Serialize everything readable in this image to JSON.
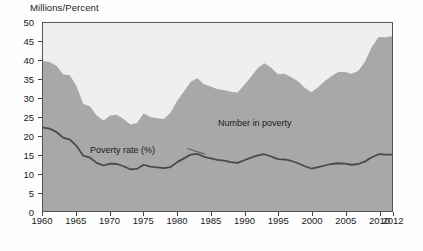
{
  "axis_title": "Millions/Percent",
  "annotations": {
    "number_in_poverty": "Number in poverty",
    "poverty_rate": "Poverty rate (%)"
  },
  "colors": {
    "area_fill": "#a8a8a8",
    "plot_background": "#efefef",
    "line": "#4a4a4a",
    "axis": "#555555"
  },
  "chart_data": {
    "type": "area",
    "title": "",
    "subtitle": "",
    "xlabel": "",
    "ylabel": "Millions/Percent",
    "xlim": [
      1960,
      2012
    ],
    "ylim": [
      0,
      50
    ],
    "grid": false,
    "legend": "inline-annotations",
    "ytick_labels": [
      0,
      5,
      10,
      15,
      20,
      25,
      30,
      35,
      40,
      45,
      50
    ],
    "xtick_labels": [
      1960,
      1965,
      1970,
      1975,
      1980,
      1985,
      1990,
      1995,
      2000,
      2005,
      2010,
      2012
    ],
    "x": [
      1960,
      1961,
      1962,
      1963,
      1964,
      1965,
      1966,
      1967,
      1968,
      1969,
      1970,
      1971,
      1972,
      1973,
      1974,
      1975,
      1976,
      1977,
      1978,
      1979,
      1980,
      1981,
      1982,
      1983,
      1984,
      1985,
      1986,
      1987,
      1988,
      1989,
      1990,
      1991,
      1992,
      1993,
      1994,
      1995,
      1996,
      1997,
      1998,
      1999,
      2000,
      2001,
      2002,
      2003,
      2004,
      2005,
      2006,
      2007,
      2008,
      2009,
      2010,
      2011,
      2012
    ],
    "series": [
      {
        "name": "Number in poverty",
        "units": "millions",
        "render": "area",
        "values": [
          39.9,
          39.6,
          38.6,
          36.4,
          36.1,
          33.2,
          28.5,
          27.8,
          25.4,
          24.1,
          25.4,
          25.6,
          24.5,
          23.0,
          23.4,
          25.9,
          25.0,
          24.7,
          24.5,
          26.1,
          29.3,
          31.8,
          34.4,
          35.3,
          33.7,
          33.1,
          32.4,
          32.2,
          31.7,
          31.5,
          33.6,
          35.7,
          38.0,
          39.3,
          38.1,
          36.4,
          36.5,
          35.6,
          34.5,
          32.8,
          31.6,
          32.9,
          34.6,
          35.9,
          37.0,
          37.0,
          36.5,
          37.3,
          39.8,
          43.6,
          46.3,
          46.2,
          46.5
        ]
      },
      {
        "name": "Poverty rate (%)",
        "units": "percent",
        "render": "line",
        "values": [
          22.2,
          21.9,
          21.0,
          19.5,
          19.0,
          17.3,
          14.7,
          14.2,
          12.8,
          12.1,
          12.6,
          12.5,
          11.9,
          11.1,
          11.2,
          12.3,
          11.8,
          11.6,
          11.4,
          11.7,
          13.0,
          14.0,
          15.0,
          15.2,
          14.4,
          14.0,
          13.6,
          13.4,
          13.0,
          12.8,
          13.5,
          14.2,
          14.8,
          15.1,
          14.5,
          13.8,
          13.7,
          13.3,
          12.7,
          11.9,
          11.3,
          11.7,
          12.1,
          12.5,
          12.7,
          12.6,
          12.3,
          12.5,
          13.2,
          14.3,
          15.1,
          15.0,
          15.0
        ]
      }
    ]
  }
}
